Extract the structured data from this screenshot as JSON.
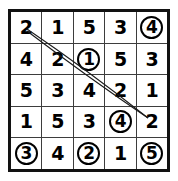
{
  "puzzle": {
    "type": "number-grid-word-search",
    "rows": 5,
    "columns": 5,
    "grid": [
      [
        {
          "value": "2",
          "circled": false
        },
        {
          "value": "1",
          "circled": false
        },
        {
          "value": "5",
          "circled": false
        },
        {
          "value": "3",
          "circled": false
        },
        {
          "value": "4",
          "circled": true
        }
      ],
      [
        {
          "value": "4",
          "circled": false
        },
        {
          "value": "2",
          "circled": false
        },
        {
          "value": "1",
          "circled": true
        },
        {
          "value": "5",
          "circled": false
        },
        {
          "value": "3",
          "circled": false
        }
      ],
      [
        {
          "value": "5",
          "circled": false
        },
        {
          "value": "3",
          "circled": false
        },
        {
          "value": "4",
          "circled": false
        },
        {
          "value": "2",
          "circled": false
        },
        {
          "value": "1",
          "circled": false
        }
      ],
      [
        {
          "value": "1",
          "circled": false
        },
        {
          "value": "5",
          "circled": false
        },
        {
          "value": "3",
          "circled": false
        },
        {
          "value": "4",
          "circled": true
        },
        {
          "value": "2",
          "circled": false
        }
      ],
      [
        {
          "value": "3",
          "circled": true
        },
        {
          "value": "4",
          "circled": false
        },
        {
          "value": "2",
          "circled": true
        },
        {
          "value": "1",
          "circled": false
        },
        {
          "value": "5",
          "circled": true
        }
      ]
    ],
    "marked_lines": [
      {
        "name": "diagonal-line-upper",
        "from": {
          "x": 19,
          "y": 20
        },
        "to": {
          "x": 140,
          "y": 109
        },
        "color": "#1a1a1a"
      },
      {
        "name": "diagonal-line-lower",
        "from": {
          "x": 19,
          "y": 20
        },
        "to": {
          "x": 140,
          "y": 109
        },
        "color": "#1a1a1a"
      }
    ],
    "colors": {
      "border": "#121212",
      "gridline": "#3d3d3d",
      "digit": "#000000",
      "circle": "#000000",
      "background": "#ffffff"
    }
  }
}
